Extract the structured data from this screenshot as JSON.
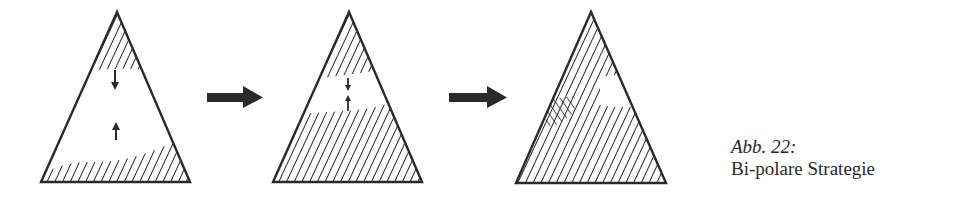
{
  "figure": {
    "label": "Abb. 22:",
    "title": "Bi-polare Strategie",
    "ink_color": "#2a2a2a",
    "background": "#ffffff",
    "panels": [
      {
        "id": "stage-1",
        "description": "Hatched regions at apex and base, white middle; arrows pointing toward each other (down from top, up from bottom)",
        "arrows": [
          "down",
          "up"
        ]
      },
      {
        "id": "stage-2",
        "description": "Hatched regions grown; small white gap in upper-middle with converging arrows",
        "arrows": [
          "down",
          "up"
        ]
      },
      {
        "id": "stage-3",
        "description": "Fully hatched triangle with cross-hatched overlap zone at left-middle and small white patch at right-middle",
        "arrows": []
      }
    ],
    "transition_arrows": 2
  }
}
